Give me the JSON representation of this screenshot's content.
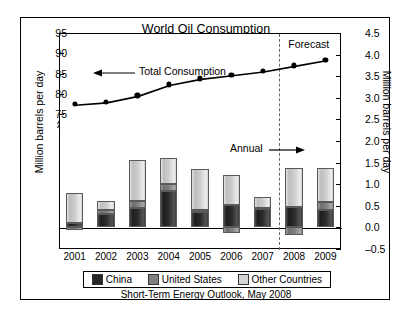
{
  "figure": {
    "title": "World Oil Consumption",
    "caption": "Short-Term Energy Outlook, May 2008",
    "forecast_label": "Forecast",
    "annual_label": "Annual",
    "series_annotation": "Total Consumption"
  },
  "axes": {
    "left_label": "Million barrels per day",
    "right_label": "Million barrels per day",
    "left_ticks": [
      "95",
      "90",
      "85",
      "80",
      "75"
    ],
    "right_ticks": [
      "4.5",
      "4.0",
      "3.5",
      "3.0",
      "2.5",
      "2.0",
      "1.5",
      "1.0",
      "0.5",
      "0.0",
      "–0.5"
    ],
    "axis_break": true
  },
  "legend": {
    "items": [
      {
        "label": "China",
        "color": "#262626"
      },
      {
        "label": "United States",
        "color": "#808080"
      },
      {
        "label": "Other Countries",
        "color": "#d4d4d4"
      }
    ]
  },
  "chart_data": {
    "type": "bar",
    "title": "World Oil Consumption",
    "xlabel": "",
    "ylabel": "Million barrels per day",
    "categories": [
      "2001",
      "2002",
      "2003",
      "2004",
      "2005",
      "2006",
      "2007",
      "2008",
      "2009"
    ],
    "grid": false,
    "legend_position": "bottom",
    "bar_axis": "right",
    "bar_ylim": [
      -0.5,
      4.5
    ],
    "bar_unit": "Million barrels per day (annual change)",
    "series": [
      {
        "name": "China",
        "color": "#262626",
        "values": [
          0.11,
          0.3,
          0.45,
          0.85,
          0.35,
          0.52,
          0.43,
          0.48,
          0.4
        ]
      },
      {
        "name": "United States",
        "color": "#808080",
        "values": [
          -0.05,
          0.1,
          0.15,
          0.15,
          0.05,
          -0.13,
          0.03,
          -0.18,
          0.18
        ]
      },
      {
        "name": "Other Countries",
        "color": "#d4d4d4",
        "values": [
          0.69,
          0.22,
          0.95,
          0.6,
          0.95,
          0.7,
          0.24,
          0.9,
          0.8
        ]
      }
    ],
    "line_series": {
      "name": "Total Consumption",
      "axis": "left",
      "ylim": [
        75,
        95
      ],
      "unit": "Million barrels per day",
      "values": [
        77.4,
        78.0,
        79.6,
        82.3,
        83.8,
        84.7,
        85.6,
        87.0,
        88.4
      ]
    },
    "forecast_starts_at": "2008",
    "annotations": [
      {
        "text": "Total Consumption",
        "points_to": "line"
      },
      {
        "text": "Annual",
        "points_to": "forecast-divider"
      },
      {
        "text": "Forecast",
        "points_to": "forecast-region"
      }
    ]
  }
}
